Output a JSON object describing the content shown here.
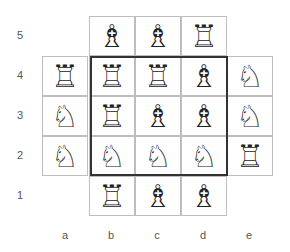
{
  "diagram": {
    "files": [
      "a",
      "b",
      "c",
      "d",
      "e"
    ],
    "ranks": [
      "5",
      "4",
      "3",
      "2",
      "1"
    ],
    "glyphs": {
      "rook": "♖",
      "knight": "♘",
      "bishop": "♗"
    },
    "squares": [
      {
        "square": "b5",
        "piece": "bishop"
      },
      {
        "square": "c5",
        "piece": "bishop"
      },
      {
        "square": "d5",
        "piece": "rook"
      },
      {
        "square": "a4",
        "piece": "rook"
      },
      {
        "square": "b4",
        "piece": "rook"
      },
      {
        "square": "c4",
        "piece": "rook"
      },
      {
        "square": "d4",
        "piece": "bishop"
      },
      {
        "square": "e4",
        "piece": "knight"
      },
      {
        "square": "a3",
        "piece": "knight"
      },
      {
        "square": "b3",
        "piece": "rook"
      },
      {
        "square": "c3",
        "piece": "bishop"
      },
      {
        "square": "d3",
        "piece": "bishop"
      },
      {
        "square": "e3",
        "piece": "knight"
      },
      {
        "square": "a2",
        "piece": "knight"
      },
      {
        "square": "b2",
        "piece": "knight"
      },
      {
        "square": "c2",
        "piece": "knight"
      },
      {
        "square": "d2",
        "piece": "knight"
      },
      {
        "square": "e2",
        "piece": "rook"
      },
      {
        "square": "b1",
        "piece": "rook"
      },
      {
        "square": "c1",
        "piece": "bishop"
      },
      {
        "square": "d1",
        "piece": "bishop"
      }
    ],
    "highlight_region": {
      "from": "b4",
      "to": "d2"
    }
  }
}
